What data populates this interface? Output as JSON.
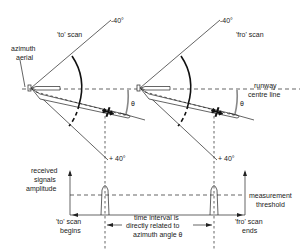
{
  "labels": {
    "azimuth_aerial": [
      "azimuth",
      "aerial"
    ],
    "to_scan": "'to' scan",
    "fro_scan": "'fro' scan",
    "minus_40_left": "-40°",
    "minus_40_right": "-40°",
    "plus_40_left": "+ 40°",
    "plus_40_right": "+ 40°",
    "runway_centre_line": [
      "runway",
      "centre line"
    ],
    "theta_left": "θ",
    "theta_right": "θ",
    "received_signals_amplitude": [
      "received",
      "signals",
      "amplitude"
    ],
    "measurement_threshold": [
      "measurement",
      "threshold"
    ],
    "to_scan_begins": [
      "'to' scan",
      "begins"
    ],
    "fro_scan_ends": [
      "'fro' scan",
      "ends"
    ],
    "time_interval": [
      "time interval is",
      "directly related to",
      "azimuth angle θ"
    ]
  }
}
